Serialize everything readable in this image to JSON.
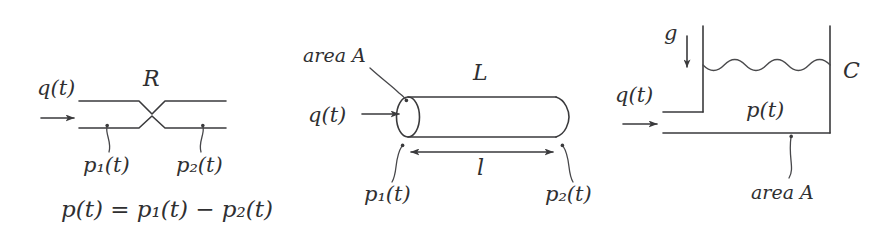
{
  "figure": {
    "background_color": "#ffffff",
    "ink_color": "#3a3a3c",
    "width": 890,
    "height": 244
  },
  "panels": [
    {
      "id": "resistance",
      "name": "fluid-resistance-element",
      "element_symbol": "R",
      "labels": {
        "flow": "q(t)",
        "parameter": "R",
        "pressure_in": "p₁(t)",
        "pressure_out": "p₂(t)",
        "equation": "p(t) = p₁(t) − p₂(t)"
      },
      "parts": {
        "flow_arrow": "right-arrow",
        "restriction": "v-notch-constriction",
        "pipe_walls": 2
      }
    },
    {
      "id": "inertance",
      "name": "fluid-inertance-element",
      "element_symbol": "L",
      "labels": {
        "area": "area A",
        "flow": "q(t)",
        "parameter": "L",
        "length": "l",
        "pressure_in": "p₁(t)",
        "pressure_out": "p₂(t)"
      },
      "parts": {
        "body": "cylinder",
        "flow_arrow": "right-arrow",
        "length_dimension": "double-headed-arrow"
      }
    },
    {
      "id": "capacitance",
      "name": "fluid-capacitance-element",
      "element_symbol": "C",
      "labels": {
        "gravity": "g",
        "flow": "q(t)",
        "pressure": "p(t)",
        "parameter": "C",
        "area": "area A"
      },
      "parts": {
        "body": "open-tank",
        "fluid_surface": "wavy-line",
        "gravity_arrow": "down-arrow",
        "flow_arrow": "right-arrow"
      }
    }
  ]
}
